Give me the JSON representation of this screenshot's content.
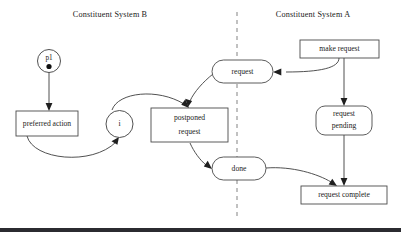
{
  "figure": {
    "width": 401,
    "height": 234,
    "background": "#ffffff",
    "stroke_color": "#3d3d3d",
    "text_color": "#1a1a1a",
    "divider_color": "#8f8f8f",
    "bottom_rule_color": "#2b2b30"
  },
  "lanes": {
    "left_title": "Constituent System B",
    "right_title": "Constituent System A",
    "divider_label": ""
  },
  "nodes": {
    "p1": {
      "label": "p1",
      "token": "●",
      "shape": "circle"
    },
    "preferred_action": {
      "label": "preferred action",
      "shape": "rect"
    },
    "i": {
      "label": "i",
      "shape": "circle"
    },
    "postponed_request": {
      "line1": "postponed",
      "line2": "request",
      "shape": "rect"
    },
    "request": {
      "label": "request",
      "shape": "stadium"
    },
    "done": {
      "label": "done",
      "shape": "stadium"
    },
    "make_request": {
      "label": "make request",
      "shape": "rect"
    },
    "request_pending": {
      "line1": "request",
      "line2": "pending",
      "shape": "rounded-rect"
    },
    "request_complete": {
      "label": "request complete",
      "shape": "rect"
    }
  },
  "edges": [
    {
      "from": "p1",
      "to": "preferred_action",
      "style": "straight-arrow"
    },
    {
      "from": "preferred_action",
      "to": "i",
      "style": "curved-arrow"
    },
    {
      "from": "i",
      "to": "postponed_request",
      "style": "curved-arrow"
    },
    {
      "from": "request",
      "to": "postponed_request",
      "style": "curved-arrow"
    },
    {
      "from": "postponed_request",
      "to": "done",
      "style": "curved-arrow"
    },
    {
      "from": "make_request",
      "to": "request",
      "style": "curved-arrow"
    },
    {
      "from": "make_request",
      "to": "request_pending",
      "style": "straight-arrow"
    },
    {
      "from": "request_pending",
      "to": "request_complete",
      "style": "straight-arrow"
    },
    {
      "from": "done",
      "to": "request_complete",
      "style": "curved-arrow"
    }
  ]
}
